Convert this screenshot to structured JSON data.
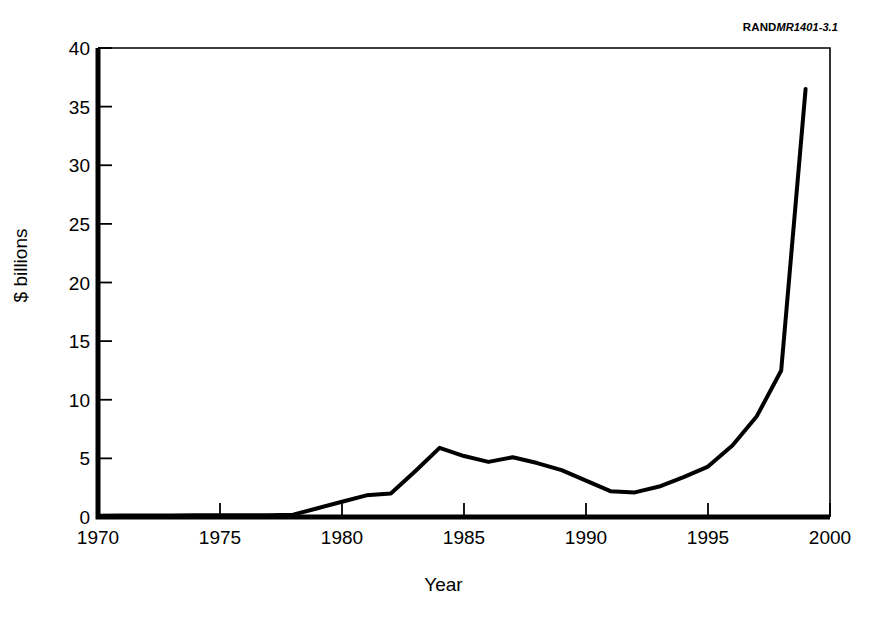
{
  "credit": {
    "org": "RAND",
    "document_id": "MR1401-3.1"
  },
  "chart_data": {
    "type": "line",
    "title": "",
    "xlabel": "Year",
    "ylabel": "$ billions",
    "xlim": [
      1970,
      2000
    ],
    "ylim": [
      0,
      40
    ],
    "xticks": [
      1970,
      1975,
      1980,
      1985,
      1990,
      1995,
      2000
    ],
    "yticks": [
      0,
      5,
      10,
      15,
      20,
      25,
      30,
      35,
      40
    ],
    "grid": false,
    "legend": null,
    "line_color": "#000000",
    "line_width_px": 4,
    "x": [
      1970,
      1971,
      1972,
      1973,
      1974,
      1975,
      1976,
      1977,
      1978,
      1979,
      1980,
      1981,
      1982,
      1983,
      1984,
      1985,
      1986,
      1987,
      1988,
      1989,
      1990,
      1991,
      1992,
      1993,
      1994,
      1995,
      1996,
      1997,
      1998,
      1999
    ],
    "values": [
      0.1,
      0.12,
      0.12,
      0.12,
      0.15,
      0.15,
      0.15,
      0.15,
      0.2,
      0.75,
      1.3,
      1.85,
      2.0,
      3.9,
      5.9,
      5.2,
      4.7,
      5.1,
      4.6,
      4.0,
      3.1,
      2.2,
      2.1,
      2.6,
      3.4,
      4.3,
      6.1,
      8.6,
      12.5,
      36.5
    ],
    "series_name": "",
    "annotations": []
  }
}
